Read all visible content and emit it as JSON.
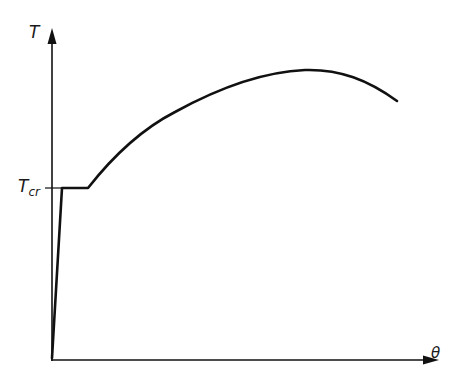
{
  "diagram": {
    "title": "",
    "y_axis": {
      "label": "T"
    },
    "x_axis": {
      "label": "θ"
    },
    "tick_label": {
      "main": "T",
      "sub": "cr"
    },
    "line_color": "#111111",
    "background": "#ffffff",
    "curve_description": "Steep near-vertical rise from origin to T_cr, short horizontal plateau at T_cr, then concave-down rise to a maximum followed by a decline"
  }
}
